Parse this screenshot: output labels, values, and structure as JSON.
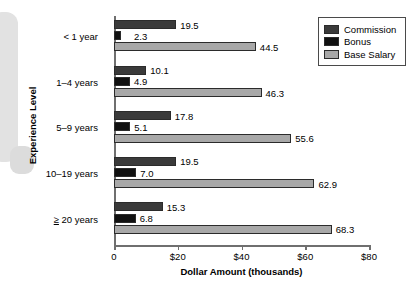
{
  "chart_data": {
    "type": "bar",
    "orientation": "horizontal",
    "title": "",
    "xlabel": "Dollar Amount (thousands)",
    "ylabel": "Experience Level",
    "xlim": [
      0,
      80
    ],
    "xticks": [
      0,
      20,
      40,
      60,
      80
    ],
    "xtick_labels": [
      "0",
      "$20",
      "$40",
      "$60",
      "$80"
    ],
    "grid": false,
    "legend_position": "top-right",
    "categories": [
      "< 1 year",
      "1–4 years",
      "5–9 years",
      "10–19 years",
      "≥ 20 years"
    ],
    "series": [
      {
        "name": "Commission",
        "color": "#3a3a3a",
        "values": [
          19.5,
          10.1,
          17.8,
          19.5,
          15.3
        ],
        "labels": [
          "19.5",
          "10.1",
          "17.8",
          "19.5",
          "15.3"
        ]
      },
      {
        "name": "Bonus",
        "color": "#111111",
        "values": [
          2.3,
          4.9,
          5.1,
          7.0,
          6.8
        ],
        "labels": [
          "2.3",
          "4.9",
          "5.1",
          "7.0",
          "6.8"
        ]
      },
      {
        "name": "Base Salary",
        "color": "#a8a8a8",
        "values": [
          44.5,
          46.3,
          55.6,
          62.9,
          68.3
        ],
        "labels": [
          "44.5",
          "46.3",
          "55.6",
          "62.9",
          "68.3"
        ]
      }
    ]
  },
  "legend": {
    "items": [
      {
        "label": "Commission",
        "color": "#3a3a3a"
      },
      {
        "label": "Bonus",
        "color": "#111111"
      },
      {
        "label": "Base Salary",
        "color": "#a8a8a8"
      }
    ]
  },
  "axes": {
    "x_title": "Dollar Amount (thousands)",
    "y_title": "Experience Level",
    "x_tick_labels": [
      "0",
      "$20",
      "$40",
      "$60",
      "$80"
    ],
    "y_tick_labels": [
      "< 1 year",
      "1–4 years",
      "5–9 years",
      "10–19 years",
      "≥ 20 years"
    ]
  }
}
